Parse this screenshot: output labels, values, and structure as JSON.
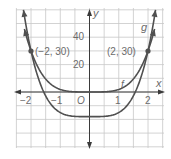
{
  "chart_data": {
    "type": "line",
    "title": "",
    "xlabel": "x",
    "ylabel": "y",
    "xlim": [
      -2.5,
      2.5
    ],
    "ylim": [
      -40,
      60
    ],
    "grid": true,
    "x_ticks": [
      -2,
      -1,
      1,
      2
    ],
    "x_tick_labels": [
      "−2",
      "−1",
      "1",
      "2"
    ],
    "y_ticks": [
      20,
      40
    ],
    "y_tick_labels": [
      "20",
      "40"
    ],
    "origin_label": "O",
    "series": [
      {
        "name": "f",
        "expression": "1.875x^4",
        "x": [
          -2.2,
          -2,
          -1.5,
          -1,
          -0.5,
          0,
          0.5,
          1,
          1.5,
          2,
          2.2
        ],
        "values": [
          43.9,
          30,
          9.5,
          1.9,
          0.1,
          0,
          0.1,
          1.9,
          9.5,
          30,
          43.9
        ]
      },
      {
        "name": "g",
        "expression": "3x^4 - 18",
        "x": [
          -2.15,
          -2,
          -1.5,
          -1,
          -0.5,
          0,
          0.5,
          1,
          1.5,
          2,
          2.15
        ],
        "values": [
          46.1,
          30,
          -2.8,
          -15,
          -17.8,
          -18,
          -17.8,
          -15,
          -2.8,
          30,
          46.1
        ]
      }
    ],
    "annotations": [
      {
        "label": "(−2, 30)",
        "x": -2,
        "y": 30
      },
      {
        "label": "(2, 30)",
        "x": 2,
        "y": 30
      },
      {
        "label": "f",
        "x": 1.2,
        "y": 6
      },
      {
        "label": "g",
        "x": 1.8,
        "y": 45
      }
    ]
  },
  "labels": {
    "x_axis": "x",
    "y_axis": "y",
    "origin": "O",
    "tick_x_m2": "−2",
    "tick_x_m1": "−1",
    "tick_x_1": "1",
    "tick_x_2": "2",
    "tick_y_20": "20",
    "tick_y_40": "40",
    "point_left": "(−2, 30)",
    "point_right": "(2, 30)",
    "curve_f": "f",
    "curve_g": "g"
  },
  "colors": {
    "curve": "#505050",
    "grid": "#c8c8c8",
    "axis": "#3a3a3a",
    "label": "#6b6b6b"
  }
}
